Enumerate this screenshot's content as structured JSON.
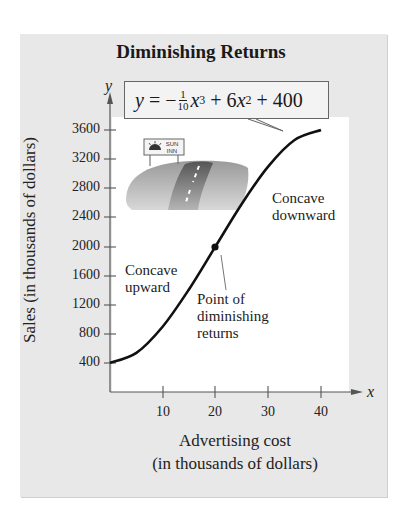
{
  "chart_data": {
    "type": "line",
    "title": "Diminishing Returns",
    "equation": "y = -(1/10)x^3 + 6x^2 + 400",
    "equation_parts": {
      "lhs": "y",
      "minus": " = −",
      "frac_num": "1",
      "frac_den": "10",
      "term1": "x",
      "exp1": "3",
      "plus1": " + 6",
      "term2": "x",
      "exp2": "2",
      "rest": " + 400"
    },
    "xlabel": "Advertising cost (in thousands of dollars)",
    "xlabel_line1": "Advertising cost",
    "xlabel_line2": "(in thousands of dollars)",
    "ylabel": "Sales (in thousands of dollars)",
    "x_axis_symbol": "x",
    "y_axis_symbol": "y",
    "xlim": [
      0,
      45
    ],
    "ylim": [
      0,
      3900
    ],
    "x_ticks": [
      10,
      20,
      30,
      40
    ],
    "y_ticks": [
      400,
      800,
      1200,
      1600,
      2000,
      2400,
      2800,
      3200,
      3600
    ],
    "grid": false,
    "series": [
      {
        "name": "Sales",
        "x": [
          0,
          5,
          10,
          15,
          20,
          25,
          30,
          35,
          40
        ],
        "y": [
          400,
          537.5,
          900,
          1412.5,
          2000,
          2587.5,
          3100,
          3462.5,
          3600
        ]
      }
    ],
    "highlighted_point": {
      "x": 20,
      "y": 2000,
      "label": "Point of diminishing returns"
    },
    "annotations": [
      {
        "text": "Concave upward",
        "lines": [
          "Concave",
          "upward"
        ]
      },
      {
        "text": "Concave downward",
        "lines": [
          "Concave",
          "downward"
        ]
      },
      {
        "text": "Point of diminishing returns",
        "lines": [
          "Point of",
          "diminishing",
          "returns"
        ]
      }
    ],
    "illustration": {
      "sign_line1": "SUN",
      "sign_line2": "INN",
      "sign_small": "TRELL"
    }
  }
}
